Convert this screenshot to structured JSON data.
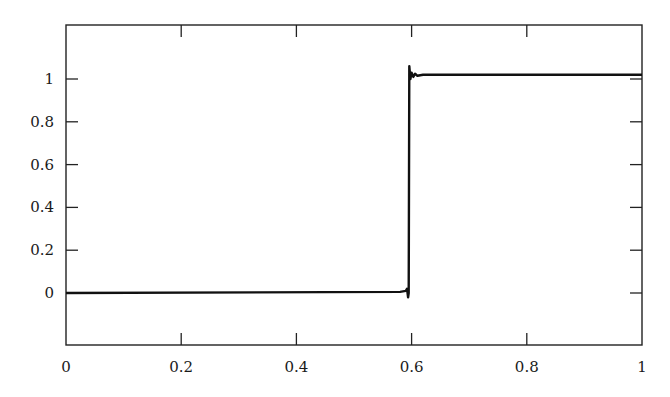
{
  "chart_data": {
    "type": "line",
    "title": "",
    "xlabel": "",
    "ylabel": "",
    "xlim": [
      0,
      1
    ],
    "ylim": [
      -0.24,
      1.25
    ],
    "grid": false,
    "legend": null,
    "xticks": [
      0,
      0.2,
      0.4,
      0.6,
      0.8,
      1
    ],
    "xtick_labels": [
      "0",
      "0.2",
      "0.4",
      "0.6",
      "0.8",
      "1"
    ],
    "yticks": [
      0,
      0.2,
      0.4,
      0.6,
      0.8,
      1
    ],
    "ytick_labels": [
      "0",
      "0.2",
      "0.4",
      "0.6",
      "0.8",
      "1"
    ],
    "series": [
      {
        "name": "step",
        "color": "#111111",
        "x": [
          0,
          0.58,
          0.59,
          0.592,
          0.594,
          0.595,
          0.596,
          0.598,
          0.6,
          0.603,
          0.606,
          0.61,
          0.62,
          1
        ],
        "y": [
          0,
          0.005,
          0.01,
          0.02,
          -0.02,
          0.0,
          1.06,
          1.0,
          1.03,
          1.01,
          1.025,
          1.015,
          1.02,
          1.02
        ]
      }
    ],
    "annotations": []
  },
  "colors": {
    "axis": "#222222",
    "line": "#111111",
    "background": "#ffffff"
  }
}
